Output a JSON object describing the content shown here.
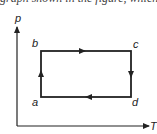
{
  "header": {
    "cutoff_text": "graph shown in the figure, which"
  },
  "diagram": {
    "type": "p-T cycle diagram",
    "axes": {
      "y_label": "p",
      "x_label": "T"
    },
    "points": [
      {
        "id": "a",
        "label": "a",
        "position": "bottom-left"
      },
      {
        "id": "b",
        "label": "b",
        "position": "top-left"
      },
      {
        "id": "c",
        "label": "c",
        "position": "top-right"
      },
      {
        "id": "d",
        "label": "d",
        "position": "bottom-right"
      }
    ],
    "cycle": [
      "a",
      "b",
      "c",
      "d",
      "a"
    ],
    "colors": {
      "line": "#222222",
      "background": "#ffffff"
    }
  }
}
